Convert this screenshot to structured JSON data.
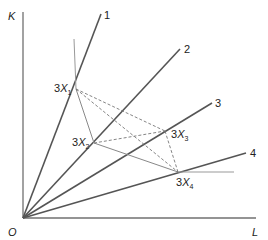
{
  "diagram": {
    "type": "isoquant-activity-analysis",
    "axes": {
      "y_label": "K",
      "x_label": "L",
      "origin_label": "O"
    },
    "rays": [
      {
        "id": "1",
        "label": "1"
      },
      {
        "id": "2",
        "label": "2"
      },
      {
        "id": "3",
        "label": "3"
      },
      {
        "id": "4",
        "label": "4"
      }
    ],
    "points": [
      {
        "id": "3X1",
        "prefix": "3",
        "var": "X",
        "sub": "1"
      },
      {
        "id": "3X2",
        "prefix": "3",
        "var": "X",
        "sub": "2"
      },
      {
        "id": "3X3",
        "prefix": "3",
        "var": "X",
        "sub": "3"
      },
      {
        "id": "3X4",
        "prefix": "3",
        "var": "X",
        "sub": "4"
      }
    ],
    "isoquant_segments": [
      "vertical-to-3X1",
      "3X1-3X2",
      "3X2-3X4",
      "3X4-horizontal"
    ],
    "dashed_segments": [
      "3X1-3X3",
      "3X1-3X4",
      "3X2-3X3",
      "3X3-3X4"
    ],
    "colors": {
      "axis": "#707070",
      "ray": "#555555",
      "isoquant": "#888888",
      "dashed": "#777777"
    }
  }
}
